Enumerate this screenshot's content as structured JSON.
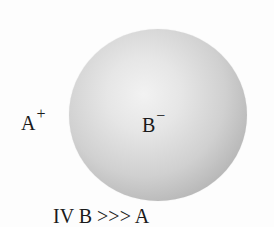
{
  "diagram": {
    "sphere": {
      "description": "large shaded sphere representing anion",
      "fill_light": "#f2f2f2",
      "fill_dark": "#9d9d9d"
    },
    "cation_label": {
      "symbol": "A",
      "charge": "+"
    },
    "anion_label": {
      "symbol": "B",
      "charge": "−"
    },
    "caption": "IV B >>> A"
  }
}
